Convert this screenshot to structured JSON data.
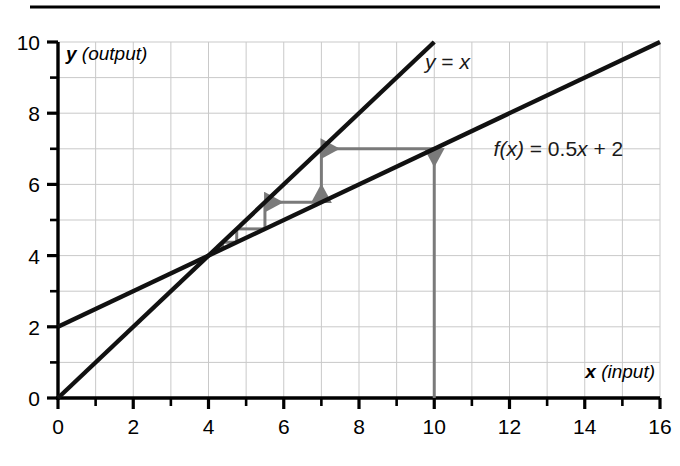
{
  "figure": {
    "top_rule": true,
    "background": "#ffffff"
  },
  "labels": {
    "x_axis_var": "x",
    "x_axis_paren": "(input)",
    "y_axis_var": "y",
    "y_axis_paren": "(output)",
    "identity_line": "y = x",
    "function_line_prefix": "f(x)",
    "function_line_rest": " = 0.5x + 2"
  },
  "colors": {
    "line": "#111111",
    "grid": "#c9c9c9",
    "axis": "#000000",
    "cobweb": "#7a7a7a",
    "rule": "#000000"
  },
  "chart_data": {
    "type": "line",
    "title": "",
    "xlabel": "x (input)",
    "ylabel": "y (output)",
    "xlim": [
      0,
      16
    ],
    "ylim": [
      0,
      10
    ],
    "xticks": [
      0,
      1,
      2,
      3,
      4,
      5,
      6,
      7,
      8,
      9,
      10,
      11,
      12,
      13,
      14,
      15,
      16
    ],
    "xtick_labels": [
      "0",
      "",
      "2",
      "",
      "4",
      "",
      "6",
      "",
      "8",
      "",
      "10",
      "",
      "12",
      "",
      "14",
      "",
      "16"
    ],
    "yticks": [
      0,
      1,
      2,
      3,
      4,
      5,
      6,
      7,
      8,
      9,
      10
    ],
    "ytick_labels": [
      "0",
      "",
      "2",
      "",
      "4",
      "",
      "6",
      "",
      "8",
      "",
      "10"
    ],
    "grid": true,
    "grid_step_x": 1,
    "grid_step_y": 1,
    "legend": "none",
    "series": [
      {
        "name": "y = x",
        "kind": "line",
        "equation": "y = x",
        "slope": 1,
        "intercept": 0,
        "points": [
          [
            0,
            0
          ],
          [
            10,
            10
          ]
        ],
        "label_at": [
          10.35,
          9.45
        ]
      },
      {
        "name": "f(x) = 0.5x + 2",
        "kind": "line",
        "equation": "f(x) = 0.5x + 2",
        "slope": 0.5,
        "intercept": 2,
        "points": [
          [
            0,
            2
          ],
          [
            16,
            10
          ]
        ],
        "label_at": [
          13.3,
          7.0
        ]
      }
    ],
    "fixed_point": [
      4,
      4
    ],
    "annotations": {
      "name": "cobweb-iteration",
      "start_x": 10,
      "color": "#7a7a7a",
      "segments": [
        {
          "from": [
            10,
            0
          ],
          "to": [
            10,
            7
          ],
          "dir": "up",
          "arrow": true
        },
        {
          "from": [
            10,
            7
          ],
          "to": [
            7,
            7
          ],
          "dir": "left",
          "arrow": true
        },
        {
          "from": [
            7,
            7
          ],
          "to": [
            7,
            5.5
          ],
          "dir": "down",
          "arrow": true
        },
        {
          "from": [
            7,
            5.5
          ],
          "to": [
            5.5,
            5.5
          ],
          "dir": "left",
          "arrow": true
        },
        {
          "from": [
            5.5,
            5.5
          ],
          "to": [
            5.5,
            4.75
          ],
          "dir": "down",
          "arrow": false
        },
        {
          "from": [
            5.5,
            4.75
          ],
          "to": [
            4.75,
            4.75
          ],
          "dir": "left",
          "arrow": false
        },
        {
          "from": [
            4.75,
            4.75
          ],
          "to": [
            4.75,
            4.375
          ],
          "dir": "down",
          "arrow": false
        },
        {
          "from": [
            4.75,
            4.375
          ],
          "to": [
            4.375,
            4.375
          ],
          "dir": "left",
          "arrow": false
        },
        {
          "from": [
            4.375,
            4.375
          ],
          "to": [
            4.375,
            4.1875
          ],
          "dir": "down",
          "arrow": false
        },
        {
          "from": [
            4.375,
            4.1875
          ],
          "to": [
            4.1875,
            4.1875
          ],
          "dir": "left",
          "arrow": false
        }
      ],
      "iterates": [
        10,
        7,
        5.5,
        4.75,
        4.375,
        4.1875
      ]
    }
  }
}
